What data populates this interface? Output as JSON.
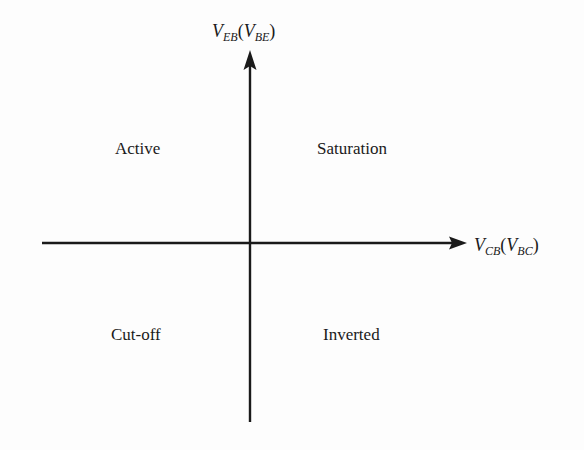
{
  "diagram": {
    "type": "quadrant-diagram",
    "axes": {
      "vertical": {
        "symbol": "V",
        "subscript": "EB",
        "alt_symbol": "V",
        "alt_subscript": "BE",
        "open_paren": "(",
        "close_paren": ")"
      },
      "horizontal": {
        "symbol": "V",
        "subscript": "CB",
        "alt_symbol": "V",
        "alt_subscript": "BC",
        "open_paren": "(",
        "close_paren": ")"
      }
    },
    "quadrants": {
      "top_left": "Active",
      "top_right": "Saturation",
      "bottom_left": "Cut-off",
      "bottom_right": "Inverted"
    },
    "colors": {
      "line": "#1a1a1a",
      "background": "#fdfdfd"
    }
  }
}
